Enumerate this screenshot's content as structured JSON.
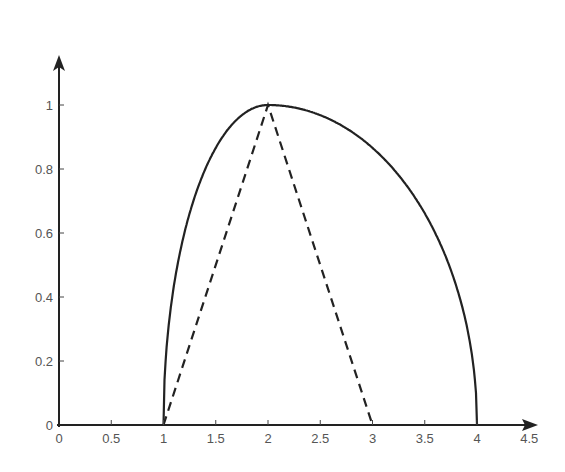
{
  "chart_data": {
    "type": "line",
    "title": "",
    "xlabel": "",
    "ylabel": "",
    "xlim": [
      0,
      4.5
    ],
    "ylim": [
      0,
      1.2
    ],
    "grid": false,
    "legend": null,
    "x_ticks": [
      "0",
      "0.5",
      "1",
      "1.5",
      "2",
      "2.5",
      "3",
      "3.5",
      "4",
      "4.5"
    ],
    "y_ticks": [
      "0",
      "0.2",
      "0.4",
      "0.6",
      "0.8",
      "1"
    ],
    "series": [
      {
        "name": "solid-curve",
        "style": "solid",
        "description": "Asymmetric elliptic membership: left half-radius 1 from x=1 to 2, right half-radius 2 from x=2 to 4",
        "x": [
          1,
          1.1,
          1.25,
          1.5,
          1.75,
          2,
          2.25,
          2.5,
          2.75,
          3,
          3.25,
          3.5,
          3.75,
          3.9,
          4
        ],
        "y": [
          0,
          0.436,
          0.661,
          0.866,
          0.968,
          1,
          0.992,
          0.968,
          0.927,
          0.866,
          0.781,
          0.661,
          0.484,
          0.312,
          0
        ]
      },
      {
        "name": "dashed-triangle",
        "style": "dashed",
        "x": [
          1,
          2,
          3
        ],
        "y": [
          0,
          1,
          0
        ]
      }
    ]
  },
  "axes": {
    "x_origin_label": "0",
    "y_origin_label": "0"
  }
}
